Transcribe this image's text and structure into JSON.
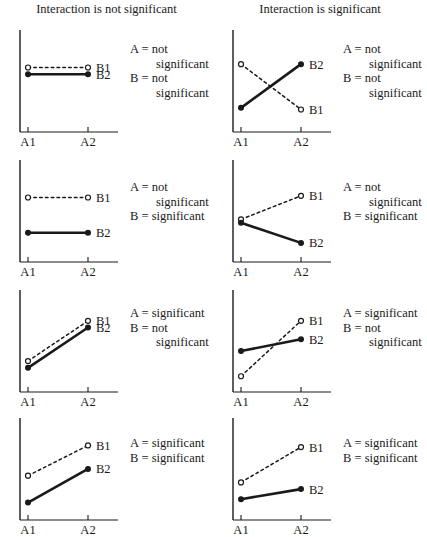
{
  "figure": {
    "width": 427,
    "height": 537,
    "background": "#ffffff",
    "ink": "#1a1a1a"
  },
  "columns": [
    {
      "title": "Interaction is not significant"
    },
    {
      "title": "Interaction is significant"
    }
  ],
  "axis": {
    "x_tick_labels": [
      "A1",
      "A2"
    ],
    "series_labels": [
      "B1",
      "B2"
    ]
  },
  "legend": {
    "b1_style": "dashed-open-circle",
    "b2_style": "solid-filled-circle"
  },
  "chart_data": {
    "type": "line",
    "xlabel": "Factor A",
    "ylabel": "Response",
    "x": [
      "A1",
      "A2"
    ],
    "ylim": [
      0,
      100
    ],
    "grid": false,
    "legend_position": "right-of-point",
    "panels": [
      {
        "id": "r1c1",
        "row": 1,
        "column": 1,
        "column_title": "Interaction is not significant",
        "effect_a": "not significant",
        "effect_b": "not significant",
        "note_lines": [
          "A = not",
          "significant",
          "B = not",
          "significant"
        ],
        "series": [
          {
            "name": "B1",
            "style": "dashed",
            "marker": "open",
            "values": [
              72,
              72
            ]
          },
          {
            "name": "B2",
            "style": "solid",
            "marker": "filled",
            "values": [
              64,
              64
            ]
          }
        ]
      },
      {
        "id": "r1c2",
        "row": 1,
        "column": 2,
        "column_title": "Interaction is significant",
        "effect_a": "not significant",
        "effect_b": "not significant",
        "note_lines": [
          "A = not",
          "significant",
          "B = not",
          "significant"
        ],
        "series": [
          {
            "name": "B1",
            "style": "dashed",
            "marker": "open",
            "values": [
              76,
              22
            ]
          },
          {
            "name": "B2",
            "style": "solid",
            "marker": "filled",
            "values": [
              24,
              76
            ]
          }
        ]
      },
      {
        "id": "r2c1",
        "row": 2,
        "column": 1,
        "column_title": "Interaction is not significant",
        "effect_a": "not significant",
        "effect_b": "significant",
        "note_lines": [
          "A = not",
          "significant",
          "B = significant"
        ],
        "series": [
          {
            "name": "B1",
            "style": "dashed",
            "marker": "open",
            "values": [
              72,
              72
            ]
          },
          {
            "name": "B2",
            "style": "solid",
            "marker": "filled",
            "values": [
              30,
              30
            ]
          }
        ]
      },
      {
        "id": "r2c2",
        "row": 2,
        "column": 2,
        "column_title": "Interaction is significant",
        "effect_a": "not significant",
        "effect_b": "significant",
        "note_lines": [
          "A = not",
          "significant",
          "B = significant"
        ],
        "series": [
          {
            "name": "B1",
            "style": "dashed",
            "marker": "open",
            "values": [
              46,
              74
            ]
          },
          {
            "name": "B2",
            "style": "solid",
            "marker": "filled",
            "values": [
              42,
              18
            ]
          }
        ]
      },
      {
        "id": "r3c1",
        "row": 3,
        "column": 1,
        "column_title": "Interaction is not significant",
        "effect_a": "significant",
        "effect_b": "not significant",
        "note_lines": [
          "A = significant",
          "B = not",
          "significant"
        ],
        "series": [
          {
            "name": "B1",
            "style": "dashed",
            "marker": "open",
            "values": [
              32,
              80
            ]
          },
          {
            "name": "B2",
            "style": "solid",
            "marker": "filled",
            "values": [
              24,
              72
            ]
          }
        ]
      },
      {
        "id": "r3c2",
        "row": 3,
        "column": 2,
        "column_title": "Interaction is significant",
        "effect_a": "significant",
        "effect_b": "not significant",
        "note_lines": [
          "A = significant",
          "B = not",
          "significant"
        ],
        "series": [
          {
            "name": "B1",
            "style": "dashed",
            "marker": "open",
            "values": [
              14,
              80
            ]
          },
          {
            "name": "B2",
            "style": "solid",
            "marker": "filled",
            "values": [
              44,
              58
            ]
          }
        ]
      },
      {
        "id": "r4c1",
        "row": 4,
        "column": 1,
        "column_title": "Interaction is not significant",
        "effect_a": "significant",
        "effect_b": "significant",
        "note_lines": [
          "A = significant",
          "B = significant"
        ],
        "series": [
          {
            "name": "B1",
            "style": "dashed",
            "marker": "open",
            "values": [
              48,
              84
            ]
          },
          {
            "name": "B2",
            "style": "solid",
            "marker": "filled",
            "values": [
              16,
              56
            ]
          }
        ]
      },
      {
        "id": "r4c2",
        "row": 4,
        "column": 2,
        "column_title": "Interaction is significant",
        "effect_a": "significant",
        "effect_b": "significant",
        "note_lines": [
          "A = significant",
          "B = significant"
        ],
        "series": [
          {
            "name": "B1",
            "style": "dashed",
            "marker": "open",
            "values": [
              40,
              82
            ]
          },
          {
            "name": "B2",
            "style": "solid",
            "marker": "filled",
            "values": [
              20,
              32
            ]
          }
        ]
      }
    ]
  }
}
